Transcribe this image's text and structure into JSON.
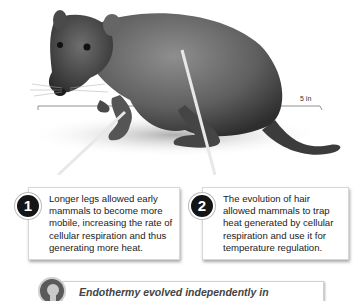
{
  "figure": {
    "scale_bar_label": "5 in"
  },
  "callouts": [
    {
      "number": "1",
      "text": "Longer legs allowed early mammals to become more mobile, increasing the rate of cellular respiration and thus generating more heat."
    },
    {
      "number": "2",
      "text": "The evolution of hair allowed mammals to trap heat generated by cellular respiration and use it for temperature regulation."
    }
  ],
  "note": {
    "icon": "lightbulb-icon",
    "text": "Endothermy evolved independently in"
  }
}
